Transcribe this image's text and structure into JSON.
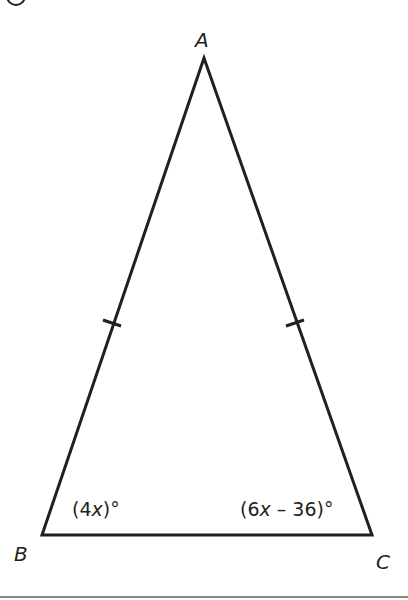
{
  "figure": {
    "type": "isosceles-triangle",
    "vertices": {
      "A": {
        "label": "A",
        "x": 204,
        "y": 58
      },
      "B": {
        "label": "B",
        "x": 42,
        "y": 535
      },
      "C": {
        "label": "C",
        "x": 372,
        "y": 535
      }
    },
    "angles": {
      "B": {
        "label_prefix": "(4",
        "var": "x",
        "label_suffix": ")°"
      },
      "C": {
        "label_prefix": "(6",
        "var": "x",
        "label_suffix": " – 36)°"
      }
    },
    "congruent_sides": [
      "AB",
      "AC"
    ],
    "stroke_color": "#231f20"
  }
}
